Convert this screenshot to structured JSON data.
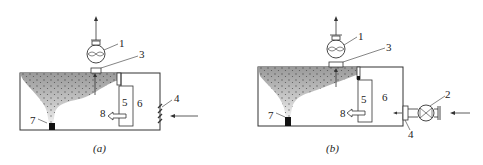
{
  "diagram": {
    "panels": [
      {
        "id": "a",
        "caption": "(a)",
        "labels": {
          "fan": "1",
          "outlet": "3",
          "louver": "4",
          "separator": "5",
          "chamber": "6",
          "drain": "7",
          "return_flow": "8"
        }
      },
      {
        "id": "b",
        "caption": "(b)",
        "labels": {
          "fan": "1",
          "inlet_fan": "2",
          "outlet": "3",
          "inlet_pipe": "4",
          "separator": "5",
          "chamber": "6",
          "drain": "7",
          "return_flow": "8"
        }
      }
    ],
    "colors": {
      "line": "#333333",
      "mist_dark": "#9a9a9a",
      "mist_light": "#e6e6e6",
      "drain": "#111111"
    }
  }
}
